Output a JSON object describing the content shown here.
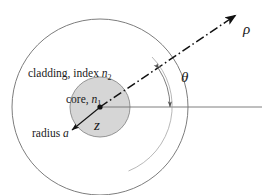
{
  "figure": {
    "type": "diagram",
    "background_color": "#ffffff",
    "stroke_color": "#5a5a5a",
    "ink_color": "#1a1a1a",
    "core_fill_color": "#d4d4d4",
    "cladding_fill_color": "#ffffff"
  },
  "labels": {
    "cladding": {
      "text": "cladding, index ",
      "symbol": "n",
      "subscript": "2"
    },
    "core": {
      "text": "core, ",
      "symbol": "n",
      "subscript": "1"
    },
    "radius": {
      "text": "radius ",
      "symbol": "a"
    },
    "axis_z": "z",
    "ray_rho": "ρ",
    "angle_theta": "θ"
  },
  "geometry": {
    "center": {
      "x": 100,
      "y": 107
    },
    "cladding_radius": 88,
    "core_radius": 30,
    "ray_angle_degrees": 33,
    "angle_arc_radius": 70,
    "horizontal_axis_end_x": 262
  }
}
